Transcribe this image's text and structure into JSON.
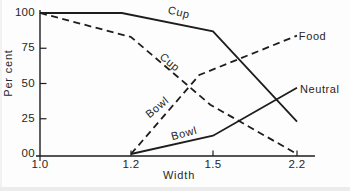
{
  "figure": {
    "background": "#fdfdfd",
    "line_color": "#1d1d1d",
    "text_color": "#262626"
  },
  "chart_data": {
    "type": "line",
    "title": "",
    "xlabel": "Width",
    "ylabel": "Per cent",
    "ylim": [
      0,
      100
    ],
    "grid": false,
    "legend": "inline-labels",
    "x_ticks": [
      {
        "value": 1.0,
        "label": "1.0"
      },
      {
        "value": 1.2,
        "label": "1.2"
      },
      {
        "value": 1.5,
        "label": "1.5"
      },
      {
        "value": 2.2,
        "label": "2.2"
      }
    ],
    "y_ticks": [
      {
        "value": 0,
        "label": "00"
      },
      {
        "value": 25,
        "label": "25"
      },
      {
        "value": 50,
        "label": "50"
      },
      {
        "value": 75,
        "label": "75"
      },
      {
        "value": 100,
        "label": "100"
      }
    ],
    "series": [
      {
        "name": "cup-neutral",
        "label": "Cup",
        "context": "neutral",
        "style": "solid",
        "points": [
          [
            1.0,
            100
          ],
          [
            1.18,
            100
          ],
          [
            1.5,
            87
          ],
          [
            2.2,
            23
          ]
        ]
      },
      {
        "name": "cup-food",
        "label": "Cup",
        "context": "food",
        "style": "dashed",
        "points": [
          [
            1.0,
            100
          ],
          [
            1.2,
            83
          ],
          [
            1.49,
            35
          ],
          [
            2.2,
            0
          ]
        ]
      },
      {
        "name": "bowl-food",
        "label": "Bowl",
        "context": "food",
        "style": "dashed",
        "points": [
          [
            1.2,
            0
          ],
          [
            1.45,
            56
          ],
          [
            2.2,
            84
          ]
        ]
      },
      {
        "name": "bowl-neutral",
        "label": "Bowl",
        "context": "neutral",
        "style": "solid",
        "points": [
          [
            1.2,
            0
          ],
          [
            1.5,
            13
          ],
          [
            2.2,
            47
          ]
        ]
      }
    ],
    "annotations": [
      {
        "id": "cup-solid",
        "text": "Cup",
        "x": 1.376,
        "y": 100.7,
        "rotation": 14
      },
      {
        "id": "cup-dashed",
        "text": "Cup",
        "x": 1.343,
        "y": 65,
        "rotation": 40
      },
      {
        "id": "bowl-dashed",
        "text": "Bowl",
        "x": 1.295,
        "y": 33,
        "rotation": -40
      },
      {
        "id": "bowl-solid",
        "text": "Bowl",
        "x": 1.394,
        "y": 15,
        "rotation": -15
      },
      {
        "id": "food",
        "text": "Food",
        "x": 2.33,
        "y": 84,
        "rotation": 0
      },
      {
        "id": "neutral",
        "text": "Neutral",
        "x": 2.39,
        "y": 46,
        "rotation": 0
      }
    ]
  }
}
